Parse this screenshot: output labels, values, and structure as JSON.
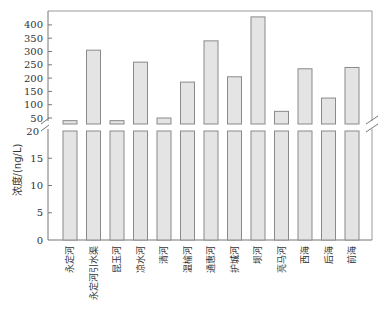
{
  "chart_data": {
    "type": "bar",
    "title": "",
    "xlabel": "",
    "ylabel": "浓度/(ng/L)",
    "broken_axis": true,
    "lower_range": [
      0,
      20
    ],
    "upper_range": [
      20,
      400
    ],
    "lower_ticks": [
      0,
      5,
      10,
      15,
      20
    ],
    "upper_ticks": [
      50,
      100,
      150,
      200,
      250,
      300,
      350,
      400
    ],
    "categories": [
      "永定河",
      "永定河引水渠",
      "昆玉河",
      "凉水河",
      "清河",
      "温榆河",
      "通惠河",
      "护城河",
      "坝河",
      "亮马河",
      "西海",
      "后海",
      "前海"
    ],
    "values": [
      40,
      305,
      40,
      260,
      50,
      185,
      340,
      205,
      430,
      75,
      235,
      125,
      240
    ],
    "grid": false,
    "legend": null,
    "colors": {
      "bar_fill": "#e4e4e4",
      "bar_stroke": "#8a8a8a",
      "axis": "#777777"
    }
  }
}
